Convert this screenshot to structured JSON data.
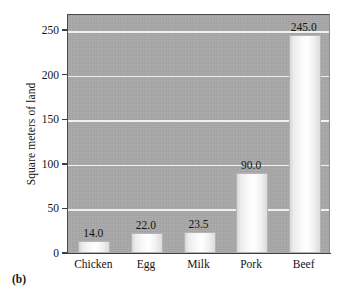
{
  "chart_data": {
    "type": "bar",
    "title": "",
    "subtitle": "",
    "xlabel": "",
    "ylabel": "Square meters of land",
    "categories": [
      "Chicken",
      "Egg",
      "Milk",
      "Pork",
      "Beef"
    ],
    "values": [
      14.0,
      22.0,
      23.5,
      90.0,
      245.0
    ],
    "value_labels": [
      "14.0",
      "22.0",
      "23.5",
      "90.0",
      "245.0"
    ],
    "ylim": [
      0,
      268
    ],
    "yticks": [
      0,
      50,
      100,
      150,
      200,
      250
    ],
    "ytick_labels": [
      "0",
      "50",
      "100",
      "150",
      "200",
      "250"
    ],
    "grid": "horizontal",
    "legend": "none",
    "panel_label": "(b)",
    "colors": {
      "plot_background": "#a9a9a9",
      "gridline": "#f0f0f0",
      "bar_fill": "#f7f7f7",
      "bar_edge": "#b4b4b4",
      "axis": "#3d3d3d",
      "text": "#141414",
      "page_background": "#ffffff"
    }
  }
}
